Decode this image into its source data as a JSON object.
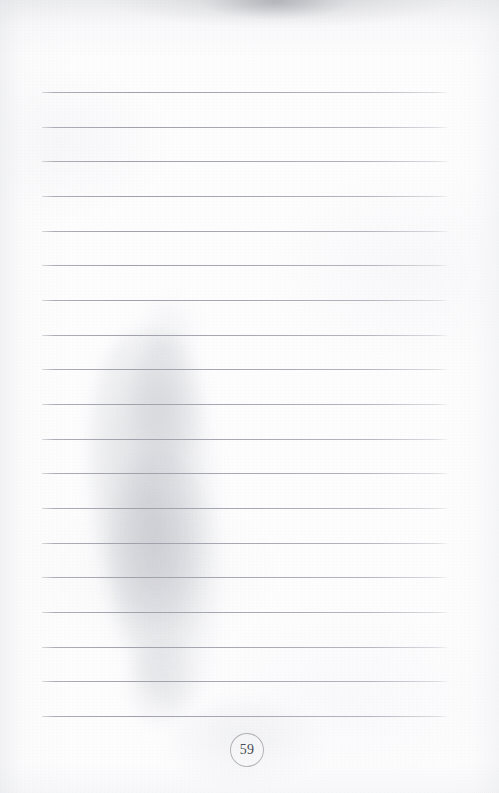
{
  "document": {
    "kind": "scanned-notebook-page",
    "page_number": "59",
    "content_text": "",
    "page_width": 499,
    "page_height": 793
  },
  "colors": {
    "paper": "#fcfcfd",
    "rule_line": "#a6a7b0",
    "page_number_ink": "#4a4c55",
    "page_number_circle": "#787a84",
    "scan_shadow": "#9698a2"
  },
  "ruled_lines": {
    "count": 19,
    "x_start": 42,
    "x_end": 448,
    "first_y": 92,
    "spacing": 34.7,
    "y_positions": [
      92,
      127,
      161,
      196,
      231,
      265,
      300,
      335,
      369,
      404,
      439,
      473,
      508,
      543,
      577,
      612,
      647,
      681,
      716
    ],
    "written_text": [
      "",
      "",
      "",
      "",
      "",
      "",
      "",
      "",
      "",
      "",
      "",
      "",
      "",
      "",
      "",
      "",
      "",
      "",
      ""
    ]
  },
  "page_number_badge": {
    "label": "59",
    "center_x": 246,
    "center_y": 749,
    "radius": 16
  },
  "scan_artifacts": {
    "top_edge_shadow": "gray gradient band across the top edge",
    "finger_shadow": "soft vertical gray blob left of center, approx x 95-210, y 335-710",
    "paper_texture": "faint mottled scan grain"
  }
}
